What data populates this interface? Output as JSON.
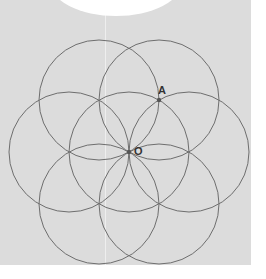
{
  "figure": {
    "type": "seed-of-life construction",
    "center_point": {
      "label": "O",
      "x": 129,
      "y": 152
    },
    "marked_point": {
      "label": "A",
      "x": 159,
      "y": 100
    },
    "radius": 60,
    "circle_centers": [
      [
        129,
        152
      ],
      [
        189,
        152
      ],
      [
        159,
        100
      ],
      [
        99,
        100
      ],
      [
        69,
        152
      ],
      [
        99,
        204
      ],
      [
        159,
        204
      ]
    ],
    "stroke_color": "#6e6e6e",
    "point_color": "#555555",
    "background_color": "#dcdcdc"
  }
}
